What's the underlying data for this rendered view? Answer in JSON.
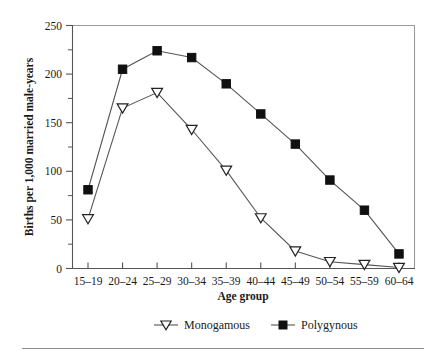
{
  "chart_data": {
    "type": "line",
    "title": "",
    "xlabel": "Age group",
    "ylabel": "Births per 1,000 married male-years",
    "categories": [
      "15–19",
      "20–24",
      "25–29",
      "30–34",
      "35–39",
      "40–44",
      "45–49",
      "50–54",
      "55–59",
      "60–64"
    ],
    "ylim": [
      0,
      250
    ],
    "yticks": [
      0,
      50,
      100,
      150,
      200,
      250
    ],
    "yticks_minor": [
      25,
      75,
      125,
      175,
      225
    ],
    "ytick_labels": [
      "0",
      "50",
      "100",
      "150",
      "200",
      "250"
    ],
    "grid": false,
    "legend_position": "below-axes",
    "series": [
      {
        "name": "Monogamous",
        "marker": "open-triangle-down",
        "values": [
          51,
          165,
          181,
          143,
          101,
          52,
          18,
          7,
          4,
          1
        ]
      },
      {
        "name": "Polygynous",
        "marker": "filled-square",
        "values": [
          81,
          205,
          224,
          217,
          190,
          159,
          128,
          91,
          60,
          15
        ]
      }
    ]
  },
  "legend": {
    "items": [
      {
        "label": "Monogamous",
        "marker": "open-triangle-down"
      },
      {
        "label": "Polygynous",
        "marker": "filled-square"
      }
    ]
  },
  "colors": {
    "axis": "#555555",
    "frame": "#9a9a9a",
    "line": "#555555",
    "marker_fill_open": "#ffffff",
    "marker_fill_solid": "#101010",
    "text": "#1a1a1a",
    "background": "#ffffff",
    "rule": "#8d8d8d"
  }
}
